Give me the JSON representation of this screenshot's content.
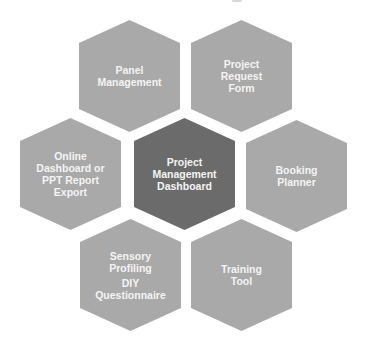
{
  "diagram": {
    "type": "hexagon-cluster",
    "colors": {
      "outer_fill": "#a9a9a9",
      "center_fill": "#6b6b6b",
      "text": "#f4f4f4",
      "background": "#ffffff"
    },
    "center": {
      "id": "project-management-dashboard",
      "lines": [
        "Project",
        "Management",
        "Dashboard"
      ]
    },
    "nodes": [
      {
        "id": "panel-management",
        "position": "top-left",
        "lines": [
          "Panel",
          "Management"
        ]
      },
      {
        "id": "project-request-form",
        "position": "top-right",
        "lines": [
          "Project",
          "Request",
          "Form"
        ]
      },
      {
        "id": "online-dashboard-ppt-export",
        "position": "left",
        "lines": [
          "Online",
          "Dashboard or",
          "PPT Report",
          "Export"
        ]
      },
      {
        "id": "booking-planner",
        "position": "right",
        "lines": [
          "Booking",
          "Planner"
        ]
      },
      {
        "id": "sensory-profiling-diy",
        "position": "bottom-left",
        "lines": [
          "Sensory",
          "Profiling"
        ],
        "lines2": [
          "DIY",
          "Questionnaire"
        ]
      },
      {
        "id": "training-tool",
        "position": "bottom-right",
        "lines": [
          "Training",
          "Tool"
        ]
      }
    ]
  }
}
